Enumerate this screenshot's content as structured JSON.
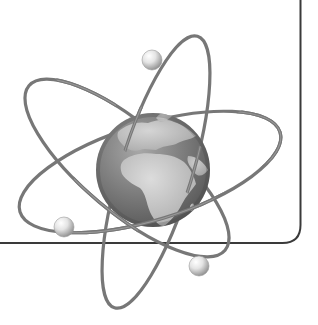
{
  "illustration": {
    "subject": "globe-with-atomic-orbits",
    "description": "Grayscale globe showing Europe and Africa, encircled by three elliptical electron orbits with three spherical electrons",
    "colors": {
      "background": "#ffffff",
      "frame_line": "#3a3a3a",
      "orbit": "#777777",
      "orbit_highlight": "#9a9a9a",
      "ocean_dark": "#5e5e5e",
      "ocean_light": "#8a8a8a",
      "land": "#c4c4c4",
      "electron_light": "#ffffff",
      "electron_dark": "#8c8c8c"
    },
    "frame": {
      "vertical_x": 300.5,
      "horizontal_y": 243,
      "corner_radius": 18
    },
    "globe": {
      "cx": 153,
      "cy": 170,
      "r": 57
    },
    "orbits": [
      {
        "name": "orbit-horizontal",
        "cx": 150,
        "cy": 172,
        "rx": 136,
        "ry": 48,
        "rotate": -17
      },
      {
        "name": "orbit-diagonal",
        "cx": 127,
        "cy": 168,
        "rx": 128,
        "ry": 44,
        "rotate": 40
      },
      {
        "name": "orbit-vertical",
        "cx": 156,
        "cy": 172,
        "rx": 142,
        "ry": 36,
        "rotate": -73
      }
    ],
    "electrons": [
      {
        "name": "electron-top",
        "cx": 152,
        "cy": 60,
        "r": 10
      },
      {
        "name": "electron-left",
        "cx": 64,
        "cy": 227,
        "r": 10
      },
      {
        "name": "electron-bottom-right",
        "cx": 199,
        "cy": 266,
        "r": 10
      }
    ]
  }
}
